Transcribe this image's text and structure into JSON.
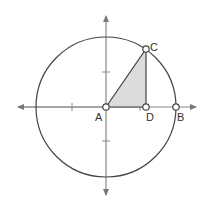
{
  "diagram": {
    "type": "unit-circle-geometry",
    "colors": {
      "stroke": "#444444",
      "axis": "#777777",
      "fill": "#dcdcdc",
      "point_fill": "#ffffff"
    },
    "points": [
      {
        "label": "A",
        "x": 106,
        "y": 107
      },
      {
        "label": "C",
        "x": 146,
        "y": 49
      },
      {
        "label": "D",
        "x": 146,
        "y": 107
      },
      {
        "label": "B",
        "x": 176,
        "y": 107
      }
    ],
    "circle": {
      "cx": 106,
      "cy": 107,
      "r": 70
    }
  }
}
